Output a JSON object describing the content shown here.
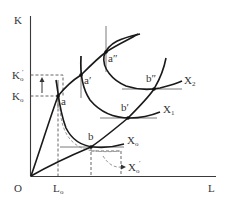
{
  "diagram": {
    "type": "economics-isoquant-expansion-path",
    "axes": {
      "y_label": "K",
      "x_label": "L",
      "origin_label": "O"
    },
    "y_ticks": [
      {
        "base": "K",
        "sub": "o",
        "prime": ""
      },
      {
        "base": "K",
        "sub": "o",
        "prime": "′"
      }
    ],
    "x_ticks": [
      {
        "base": "L",
        "sub": "o",
        "prime": ""
      }
    ],
    "points": {
      "a": "a",
      "a1": "a′",
      "a2": "a″",
      "b": "b",
      "b1": "b′",
      "b2": "b″"
    },
    "isoquants": [
      {
        "base": "X",
        "sub": "o",
        "prime": ""
      },
      {
        "base": "X",
        "sub": "1",
        "prime": ""
      },
      {
        "base": "X",
        "sub": "2",
        "prime": ""
      },
      {
        "base": "X",
        "sub": "o",
        "prime": "′"
      }
    ],
    "arrow_direction": "up"
  }
}
